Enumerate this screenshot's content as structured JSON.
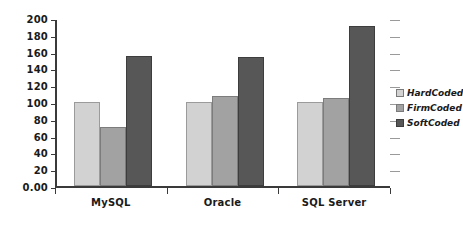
{
  "chart_data": {
    "type": "bar",
    "title": "",
    "subtitle": "",
    "xlabel": "",
    "ylabel": "",
    "categories": [
      "MySQL",
      "Oracle",
      "SQL Server"
    ],
    "series": [
      {
        "name": "HardCoded",
        "values": [
          100,
          100,
          100
        ],
        "color": "#d2d2d2"
      },
      {
        "name": "FirmCoded",
        "values": [
          70,
          107,
          105
        ],
        "color": "#a2a2a2"
      },
      {
        "name": "SoftCoded",
        "values": [
          155,
          154,
          190
        ],
        "color": "#575757"
      }
    ],
    "ylim": [
      0,
      200
    ],
    "ytick_values": [
      0,
      20,
      40,
      60,
      80,
      100,
      120,
      140,
      160,
      180,
      200
    ],
    "ytick_labels": [
      "0.00",
      "20",
      "40",
      "60",
      "80",
      "100",
      "120",
      "140",
      "160",
      "180",
      "200"
    ],
    "grid": true,
    "grid_axis": "y",
    "legend_position": "right",
    "background_color": "#ffffff",
    "axis_color": "#3a3a3a",
    "gridline_color": "#9a9a9a"
  }
}
